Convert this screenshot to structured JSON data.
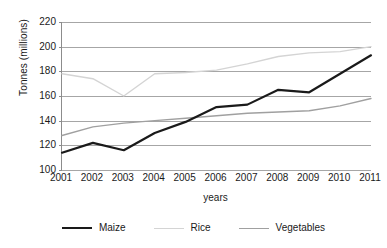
{
  "chart_data": {
    "type": "line",
    "title": "",
    "xlabel": "years",
    "ylabel": "Tonnes (millions)",
    "categories": [
      "2001",
      "2002",
      "2003",
      "2004",
      "2005",
      "2006",
      "2007",
      "2008",
      "2009",
      "2010",
      "2011"
    ],
    "x": [
      2001,
      2002,
      2003,
      2004,
      2005,
      2006,
      2007,
      2008,
      2009,
      2010,
      2011
    ],
    "ylim": [
      100,
      220
    ],
    "yticks": [
      100,
      120,
      140,
      160,
      180,
      200,
      220
    ],
    "ytick_labels": [
      "100",
      "120",
      "140",
      "160",
      "180",
      "200",
      "220"
    ],
    "grid": true,
    "legend_position": "bottom",
    "series": [
      {
        "name": "Maize",
        "color": "#1a1a1a",
        "width": 2.2,
        "values": [
          114,
          122,
          116,
          130,
          139,
          151,
          153,
          165,
          163,
          178,
          193
        ]
      },
      {
        "name": "Rice",
        "color": "#d4d4d4",
        "width": 1.4,
        "values": [
          178,
          174,
          160,
          178,
          179,
          181,
          186,
          192,
          195,
          196,
          200
        ]
      },
      {
        "name": "Vegetables",
        "color": "#a0a0a0",
        "width": 1.4,
        "values": [
          128,
          135,
          138,
          140,
          142,
          144,
          146,
          147,
          148,
          152,
          158
        ]
      }
    ]
  },
  "axis": {
    "y_title": "Tonnes (millions)",
    "x_title": "years"
  },
  "legend": {
    "items": [
      {
        "label": "Maize"
      },
      {
        "label": "Rice"
      },
      {
        "label": "Vegetables"
      }
    ]
  },
  "colors": {
    "axis_line": "#8c8c8c",
    "gridline": "#a6a6a6",
    "text": "#1a1a1a",
    "background": "#ffffff"
  }
}
